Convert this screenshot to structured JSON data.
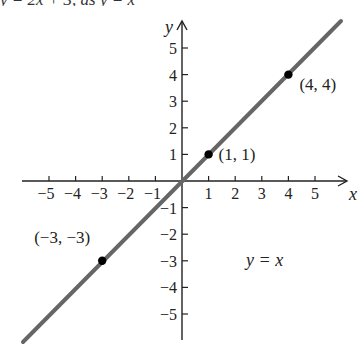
{
  "header_cutoff_text": "y = 2x + 3, as y = x",
  "chart_data": {
    "type": "line",
    "title": "",
    "xlabel": "x",
    "ylabel": "y",
    "xlim": [
      -6,
      6
    ],
    "ylim": [
      -6,
      6
    ],
    "grid": false,
    "x_ticks": [
      -5,
      -4,
      -3,
      -2,
      -1,
      1,
      2,
      3,
      4,
      5
    ],
    "y_ticks": [
      -5,
      -4,
      -3,
      -2,
      -1,
      1,
      2,
      3,
      4,
      5
    ],
    "x_tick_labels": [
      "−5",
      "−4",
      "−3",
      "−2",
      "−1",
      "1",
      "2",
      "3",
      "4",
      "5"
    ],
    "y_tick_labels": [
      "−5",
      "−4",
      "−3",
      "−2",
      "−1",
      "1",
      "2",
      "3",
      "4",
      "5"
    ],
    "series": [
      {
        "name": "y = x",
        "equation": "y = x",
        "x": [
          -6,
          6
        ],
        "y": [
          -6,
          6
        ],
        "color": "#666666"
      }
    ],
    "points": [
      {
        "x": 1,
        "y": 1,
        "label": "(1, 1)"
      },
      {
        "x": 4,
        "y": 4,
        "label": "(4, 4)"
      },
      {
        "x": -3,
        "y": -3,
        "label": "(−3, −3)"
      }
    ],
    "annotations": [
      {
        "text": "y = x",
        "x": 3.3,
        "y": -3
      }
    ]
  },
  "colors": {
    "axis": "#222222",
    "line": "#666666",
    "point": "#000000"
  }
}
